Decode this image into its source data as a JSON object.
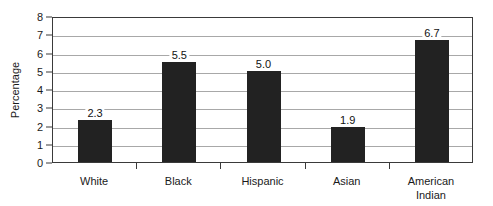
{
  "chart_data": {
    "type": "bar",
    "title": "",
    "xlabel": "",
    "ylabel": "Percentage",
    "categories": [
      "White",
      "Black",
      "Hispanic",
      "Asian",
      "American\nIndian"
    ],
    "values": [
      2.3,
      5.5,
      5.0,
      1.9,
      6.7
    ],
    "value_labels": [
      "2.3",
      "5.5",
      "5.0",
      "1.9",
      "6.7"
    ],
    "ylim": [
      0,
      8
    ],
    "ytick_labels": [
      "0",
      "1",
      "2",
      "3",
      "4",
      "5",
      "6",
      "7",
      "8"
    ],
    "ytick_values": [
      0,
      1,
      2,
      3,
      4,
      5,
      6,
      7,
      8
    ],
    "grid": true,
    "legend": "none",
    "bar_color": "#222222",
    "gridline_color": "#a8a8a8",
    "axis_color": "#3a3a3a",
    "background_color": "#ffffff"
  }
}
